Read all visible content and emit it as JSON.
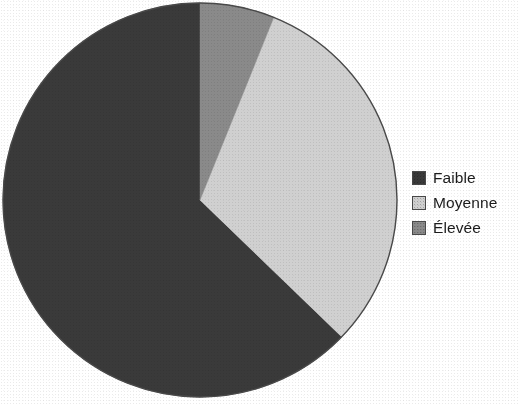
{
  "chart_data": {
    "type": "pie",
    "title": "",
    "subtitle": "",
    "xlabel": "",
    "ylabel": "",
    "legend_position": "right",
    "grid": false,
    "center": {
      "x": 200,
      "y": 200
    },
    "radius": 197,
    "start_angle_deg": 0,
    "direction": "clockwise",
    "categories": [
      "Faible",
      "Moyenne",
      "Élevée"
    ],
    "values": [
      63,
      31,
      6
    ],
    "units": "percent",
    "slices": [
      {
        "label": "Faible",
        "value": 63,
        "angle_deg": 226,
        "start_deg": 134,
        "end_deg": 360,
        "color": "#3a3a3a"
      },
      {
        "label": "Moyenne",
        "value": 31,
        "angle_deg": 112,
        "start_deg": 22,
        "end_deg": 134,
        "color": "#d0d0d0"
      },
      {
        "label": "Élevée",
        "value": 6,
        "angle_deg": 22,
        "start_deg": 0,
        "end_deg": 22,
        "color": "#8a8a8a"
      }
    ],
    "colors": {
      "faible": "#3a3a3a",
      "moyenne": "#d0d0d0",
      "elevee": "#8a8a8a",
      "outline": "#444444",
      "background": "#ffffff",
      "text": "#1b1b1b"
    }
  },
  "legend": {
    "items": [
      {
        "label": "Faible",
        "color": "#3a3a3a"
      },
      {
        "label": "Moyenne",
        "color": "#d0d0d0"
      },
      {
        "label": "Élevée",
        "color": "#8a8a8a"
      }
    ]
  }
}
